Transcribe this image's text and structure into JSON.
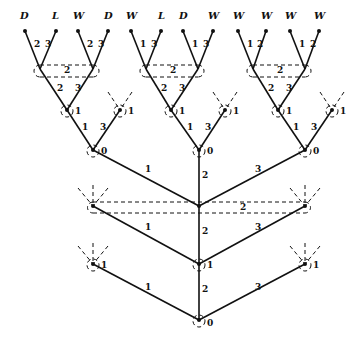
{
  "diagram": {
    "type": "game-tree",
    "leaves": [
      "D",
      "L",
      "W",
      "D",
      "W",
      "L",
      "D",
      "W",
      "W",
      "W",
      "W",
      "W"
    ],
    "leaf_edge_labels": [
      [
        "2",
        "3"
      ],
      [
        "2",
        "3"
      ],
      [
        "1",
        "3"
      ],
      [
        "1",
        "3"
      ],
      [
        "1",
        "2"
      ],
      [
        "1",
        "2"
      ]
    ],
    "info_set_labels": {
      "top_left": "2",
      "top_middle": "2",
      "top_right": "2",
      "middle": "2"
    },
    "level2_edge_labels": [
      [
        "2",
        "3"
      ],
      [
        "2",
        "3"
      ],
      [
        "2",
        "3"
      ]
    ],
    "level3_node_labels": [
      "1",
      "1",
      "1",
      "1",
      "1",
      "1"
    ],
    "level3_edge_labels": [
      [
        "1",
        "3"
      ],
      [
        "1",
        "3"
      ],
      [
        "1",
        "3"
      ]
    ],
    "level4_node_labels": [
      "0",
      "0",
      "0"
    ],
    "middle_edge_labels": [
      "1",
      "2",
      "3"
    ],
    "lower_node_labels": [
      "1",
      "1",
      "1"
    ],
    "root_edge_labels": [
      "1",
      "2",
      "3"
    ],
    "root_label": "0"
  }
}
